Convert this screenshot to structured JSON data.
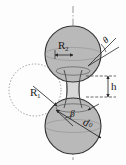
{
  "figure": {
    "background_color": "#fdfdfd",
    "ink_color": "#1a1a1a"
  },
  "labels": {
    "upper_sphere_radius": "R",
    "upper_sphere_radius_sub": "2",
    "left_sphere_radius": "R",
    "left_sphere_radius_sub": "1",
    "contact_angle": "θ",
    "bridge_height": "h",
    "half_filling_angle": "β",
    "neck_diameter": "d",
    "neck_diameter_sub": "0"
  },
  "colors": {
    "sphere_fill": "#b9b9b9",
    "sphere_fill_dark": "#a8a8a8",
    "bridge_fill": "#d8d8d8",
    "outline": "#3a3a3a",
    "dotted_circle": "#9a9a9a",
    "axis": "#7a7a7a",
    "dimension_line": "#2b2b2b"
  },
  "geometry": {
    "axis_x": 73,
    "upper_sphere_center_y": 54,
    "lower_sphere_center_y": 126,
    "sphere_radius": 28,
    "left_circle_center_x": 35,
    "left_circle_center_y": 90,
    "left_circle_radius": 26,
    "neck_half_width": 9,
    "neck_top_y": 73,
    "neck_bottom_y": 104,
    "bridge_height_top_y": 76,
    "bridge_height_bottom_y": 96
  }
}
